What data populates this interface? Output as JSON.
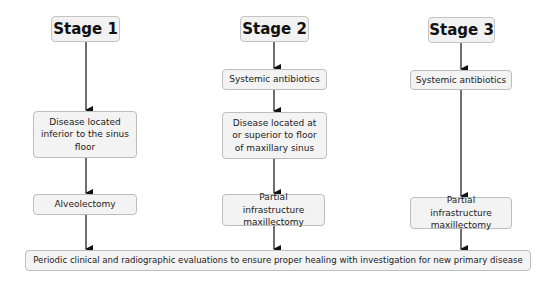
{
  "diagram": {
    "stages": [
      {
        "title": "Stage 1",
        "steps": [
          "Disease located inferior to the sinus floor",
          "Alveolectomy"
        ]
      },
      {
        "title": "Stage 2",
        "steps": [
          "Systemic antibiotics",
          "Disease located at or superior to floor of maxillary sinus",
          "Partial infrastructure maxillectomy"
        ]
      },
      {
        "title": "Stage 3",
        "steps": [
          "Systemic antibiotics",
          "Partial infrastructure maxillectomy"
        ]
      }
    ],
    "final_step": "Periodic clinical and radiographic evaluations to ensure proper healing with investigation for new primary disease"
  }
}
